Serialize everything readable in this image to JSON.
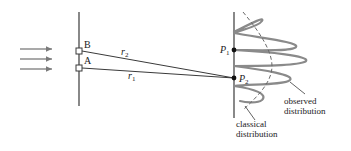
{
  "diagram": {
    "type": "double-slit interference",
    "slits": [
      {
        "label": "B",
        "id": "slit-b"
      },
      {
        "label": "A",
        "id": "slit-a"
      }
    ],
    "paths": [
      {
        "label_main": "r",
        "label_sub": "2",
        "id": "path-r2"
      },
      {
        "label_main": "r",
        "label_sub": "1",
        "id": "path-r1"
      }
    ],
    "points": [
      {
        "label_main": "P",
        "label_sub": "1",
        "id": "point-p1"
      },
      {
        "label_main": "P",
        "label_sub": "2",
        "id": "point-p2"
      }
    ],
    "annotations": {
      "observed_line1": "observed",
      "observed_line2": "distribution",
      "classical_line1": "classical",
      "classical_line2": "distribution"
    },
    "incident_arrows": 3,
    "colors": {
      "line": "#3a3a3a",
      "wave": "#8a8a8a",
      "dashed": "#6a6a6a",
      "text": "#1a1a1a"
    }
  }
}
